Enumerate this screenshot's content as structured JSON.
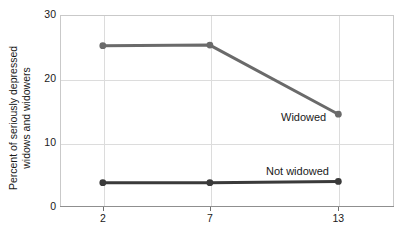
{
  "chart_data": {
    "type": "line",
    "title": "",
    "subtitle": "",
    "xlabel": "",
    "ylabel": "Percent of seriously depressed widows and widowers",
    "ylabel_lines": [
      "Percent of seriously depressed",
      "widows and widowers"
    ],
    "x": [
      2,
      7,
      13
    ],
    "xtick_labels": [
      "2",
      "7",
      "13"
    ],
    "ytick_labels": [
      "0",
      "10",
      "20",
      "30"
    ],
    "yticks": [
      0,
      10,
      20,
      30
    ],
    "xlim": [
      0,
      15.6
    ],
    "ylim": [
      0,
      30
    ],
    "grid": "horizontal-and-vertical-light",
    "legend_position": "inline-annotations",
    "series": [
      {
        "name": "Widowed",
        "label": "Widowed",
        "color": "#6a6a6a",
        "values": [
          25.2,
          25.3,
          14.5
        ],
        "marker": "circle"
      },
      {
        "name": "Not widowed",
        "label": "Not widowed",
        "color": "#3a3a3a",
        "values": [
          3.8,
          3.8,
          4.0
        ],
        "marker": "circle"
      }
    ],
    "annotations": [
      {
        "text": "Widowed",
        "x": 281,
        "y": 111
      },
      {
        "text": "Not widowed",
        "x": 266,
        "y": 165
      }
    ],
    "colors": {
      "widowed_line": "#6a6a6a",
      "not_widowed_line": "#3a3a3a",
      "gridline": "#dcdcdc",
      "axis": "#8f8f8f",
      "text": "#1a1a1a",
      "background": "#ffffff"
    }
  }
}
